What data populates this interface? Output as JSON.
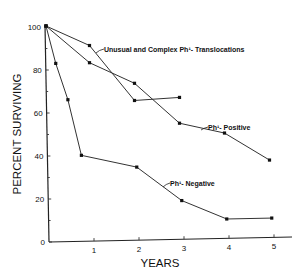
{
  "chart_data": {
    "type": "line",
    "title": "",
    "xlabel": "YEARS",
    "ylabel": "PERCENT SURVIVING",
    "xlim": [
      0,
      5.4
    ],
    "ylim": [
      0,
      100
    ],
    "x_ticks": [
      "1",
      "2",
      "3",
      "4",
      "5"
    ],
    "y_ticks": [
      "0",
      "20",
      "40",
      "60",
      "80",
      "100"
    ],
    "grid": false,
    "legend": "inline annotations",
    "series": [
      {
        "name": "Unusual and Complex Ph¹- Translocations",
        "x": [
          0,
          0.9,
          1.9,
          2.9
        ],
        "y": [
          100,
          91,
          65,
          66
        ]
      },
      {
        "name": "Ph¹- Positive",
        "x": [
          0,
          0.9,
          1.9,
          2.9,
          3.9,
          4.9
        ],
        "y": [
          100,
          83,
          73,
          54,
          49,
          36
        ]
      },
      {
        "name": "Ph¹- Negative",
        "x": [
          0,
          0.15,
          0.42,
          0.72,
          1.95,
          2.95,
          3.95,
          4.95
        ],
        "y": [
          100,
          83,
          66,
          40,
          34,
          18,
          9,
          9
        ]
      }
    ],
    "annotations": [
      {
        "text": "Unusual and Complex Ph¹- Translocations",
        "series": 0
      },
      {
        "text": "Ph¹- Positive",
        "series": 1
      },
      {
        "text": "Ph¹- Negative",
        "series": 2
      }
    ]
  }
}
